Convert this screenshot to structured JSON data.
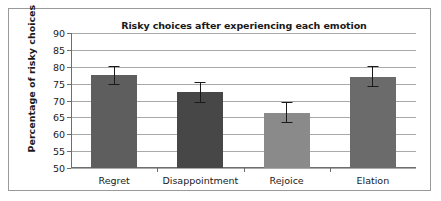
{
  "figure": {
    "border_color": "#9a9a9a",
    "background": "#ffffff"
  },
  "chart_data": {
    "type": "bar",
    "title": "Risky choices after experiencing each emotion",
    "xlabel": "",
    "ylabel": "Percentage of risky choices",
    "ylim": [
      50,
      90
    ],
    "ytick_step": 5,
    "yticks": [
      90,
      85,
      80,
      75,
      70,
      65,
      60,
      55,
      50
    ],
    "grid": true,
    "legend": false,
    "categories": [
      "Regret",
      "Disappointment",
      "Rejoice",
      "Elation"
    ],
    "values": [
      77.5,
      72.5,
      66.4,
      77.1
    ],
    "errors": [
      2.8,
      3.1,
      3.1,
      3.0
    ],
    "bar_colors": [
      "#5e5e5e",
      "#474747",
      "#8a8a8a",
      "#6b6b6b"
    ],
    "bar_patterns": [
      "solid",
      "solid",
      "solid",
      "vertical-stripes"
    ],
    "series": [
      {
        "name": "Percentage of risky choices",
        "values": [
          77.5,
          72.5,
          66.4,
          77.1
        ],
        "errors": [
          2.8,
          3.1,
          3.1,
          3.0
        ]
      }
    ]
  }
}
